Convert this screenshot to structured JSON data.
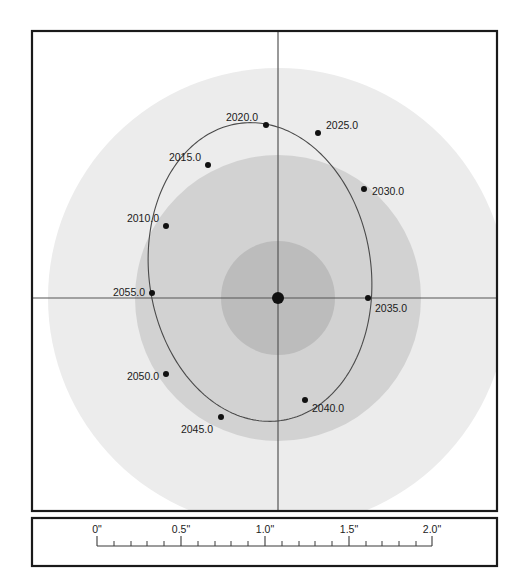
{
  "figure": {
    "kind": "visual-binary-orbit-diagram",
    "background_color": "#ffffff",
    "frame": {
      "border_color": "#1a1a1a",
      "main_panel": {
        "x": 32,
        "y": 31,
        "width": 465,
        "height": 480
      },
      "scale_panel": {
        "x": 32,
        "y": 518,
        "width": 465,
        "height": 48
      }
    },
    "axes": {
      "line_color": "#555555",
      "horizontal_y": 298,
      "vertical_x": 278
    },
    "primary_star": {
      "label": "primary-star",
      "x": 278,
      "y": 298,
      "radius": 6,
      "color": "#111111"
    },
    "halos": [
      {
        "name": "outer-halo",
        "cx": 278,
        "cy": 298,
        "r": 230,
        "color": "#ececec"
      },
      {
        "name": "middle-halo",
        "cx": 278,
        "cy": 298,
        "r": 143,
        "color": "#d2d2d2"
      },
      {
        "name": "inner-halo",
        "cx": 278,
        "cy": 298,
        "r": 57,
        "color": "#bcbcbc"
      }
    ],
    "orbit": {
      "name": "orbit-ellipse",
      "cx": 260,
      "cy": 272,
      "rx": 111,
      "ry": 150,
      "rotation_deg": -8,
      "stroke_color": "#4a4a4a",
      "stroke_width": 1.1
    }
  },
  "chart_data": {
    "type": "scatter",
    "title": "",
    "xlabel": "",
    "ylabel": "",
    "grid": false,
    "legend": null,
    "annotations": [
      "Visual binary apparent relative orbit with epoch tick marks"
    ],
    "marker_color": "#111111",
    "marker_radius": 3,
    "epoch_labels": [
      "2010.0",
      "2015.0",
      "2020.0",
      "2025.0",
      "2030.0",
      "2035.0",
      "2040.0",
      "2045.0",
      "2050.0",
      "2055.0"
    ],
    "points": [
      {
        "label": "2010.0",
        "x": 166,
        "y": 226,
        "label_x": 159,
        "label_y": 222,
        "anchor": "end"
      },
      {
        "label": "2015.0",
        "x": 208,
        "y": 165,
        "label_x": 201,
        "label_y": 161,
        "anchor": "end"
      },
      {
        "label": "2020.0",
        "x": 266,
        "y": 125,
        "label_x": 258,
        "label_y": 121,
        "anchor": "end"
      },
      {
        "label": "2025.0",
        "x": 318,
        "y": 133,
        "label_x": 326,
        "label_y": 129,
        "anchor": "start"
      },
      {
        "label": "2030.0",
        "x": 364,
        "y": 189,
        "label_x": 372,
        "label_y": 195,
        "anchor": "start"
      },
      {
        "label": "2035.0",
        "x": 368,
        "y": 298,
        "label_x": 375,
        "label_y": 312,
        "anchor": "start"
      },
      {
        "label": "2040.0",
        "x": 305,
        "y": 400,
        "label_x": 312,
        "label_y": 412,
        "anchor": "start"
      },
      {
        "label": "2045.0",
        "x": 221,
        "y": 417,
        "label_x": 213,
        "label_y": 433,
        "anchor": "end"
      },
      {
        "label": "2050.0",
        "x": 166,
        "y": 374,
        "label_x": 159,
        "label_y": 380,
        "anchor": "end"
      },
      {
        "label": "2055.0",
        "x": 152,
        "y": 293,
        "label_x": 145,
        "label_y": 296,
        "anchor": "end"
      }
    ]
  },
  "scale_bar": {
    "name": "angular-scale-bar",
    "unit": "arcsec",
    "axis_y": 546,
    "x_start": 97,
    "x_end": 432,
    "major_tick_length": 10,
    "minor_tick_length": 5,
    "line_color": "#3a3a3a",
    "major_labels": [
      "0\"",
      "0.5\"",
      "1.0\"",
      "1.5\"",
      "2.0\""
    ],
    "major_values": [
      0,
      0.5,
      1.0,
      1.5,
      2.0
    ],
    "major_positions": [
      97,
      181,
      265,
      349,
      432
    ],
    "label_positions": [
      97,
      181,
      265,
      349,
      432
    ],
    "label_y": 533,
    "minor_step": 0.1,
    "minor_positions": [
      114,
      131,
      147,
      164,
      198,
      215,
      231,
      248,
      282,
      299,
      315,
      332,
      366,
      382,
      399,
      416
    ]
  }
}
